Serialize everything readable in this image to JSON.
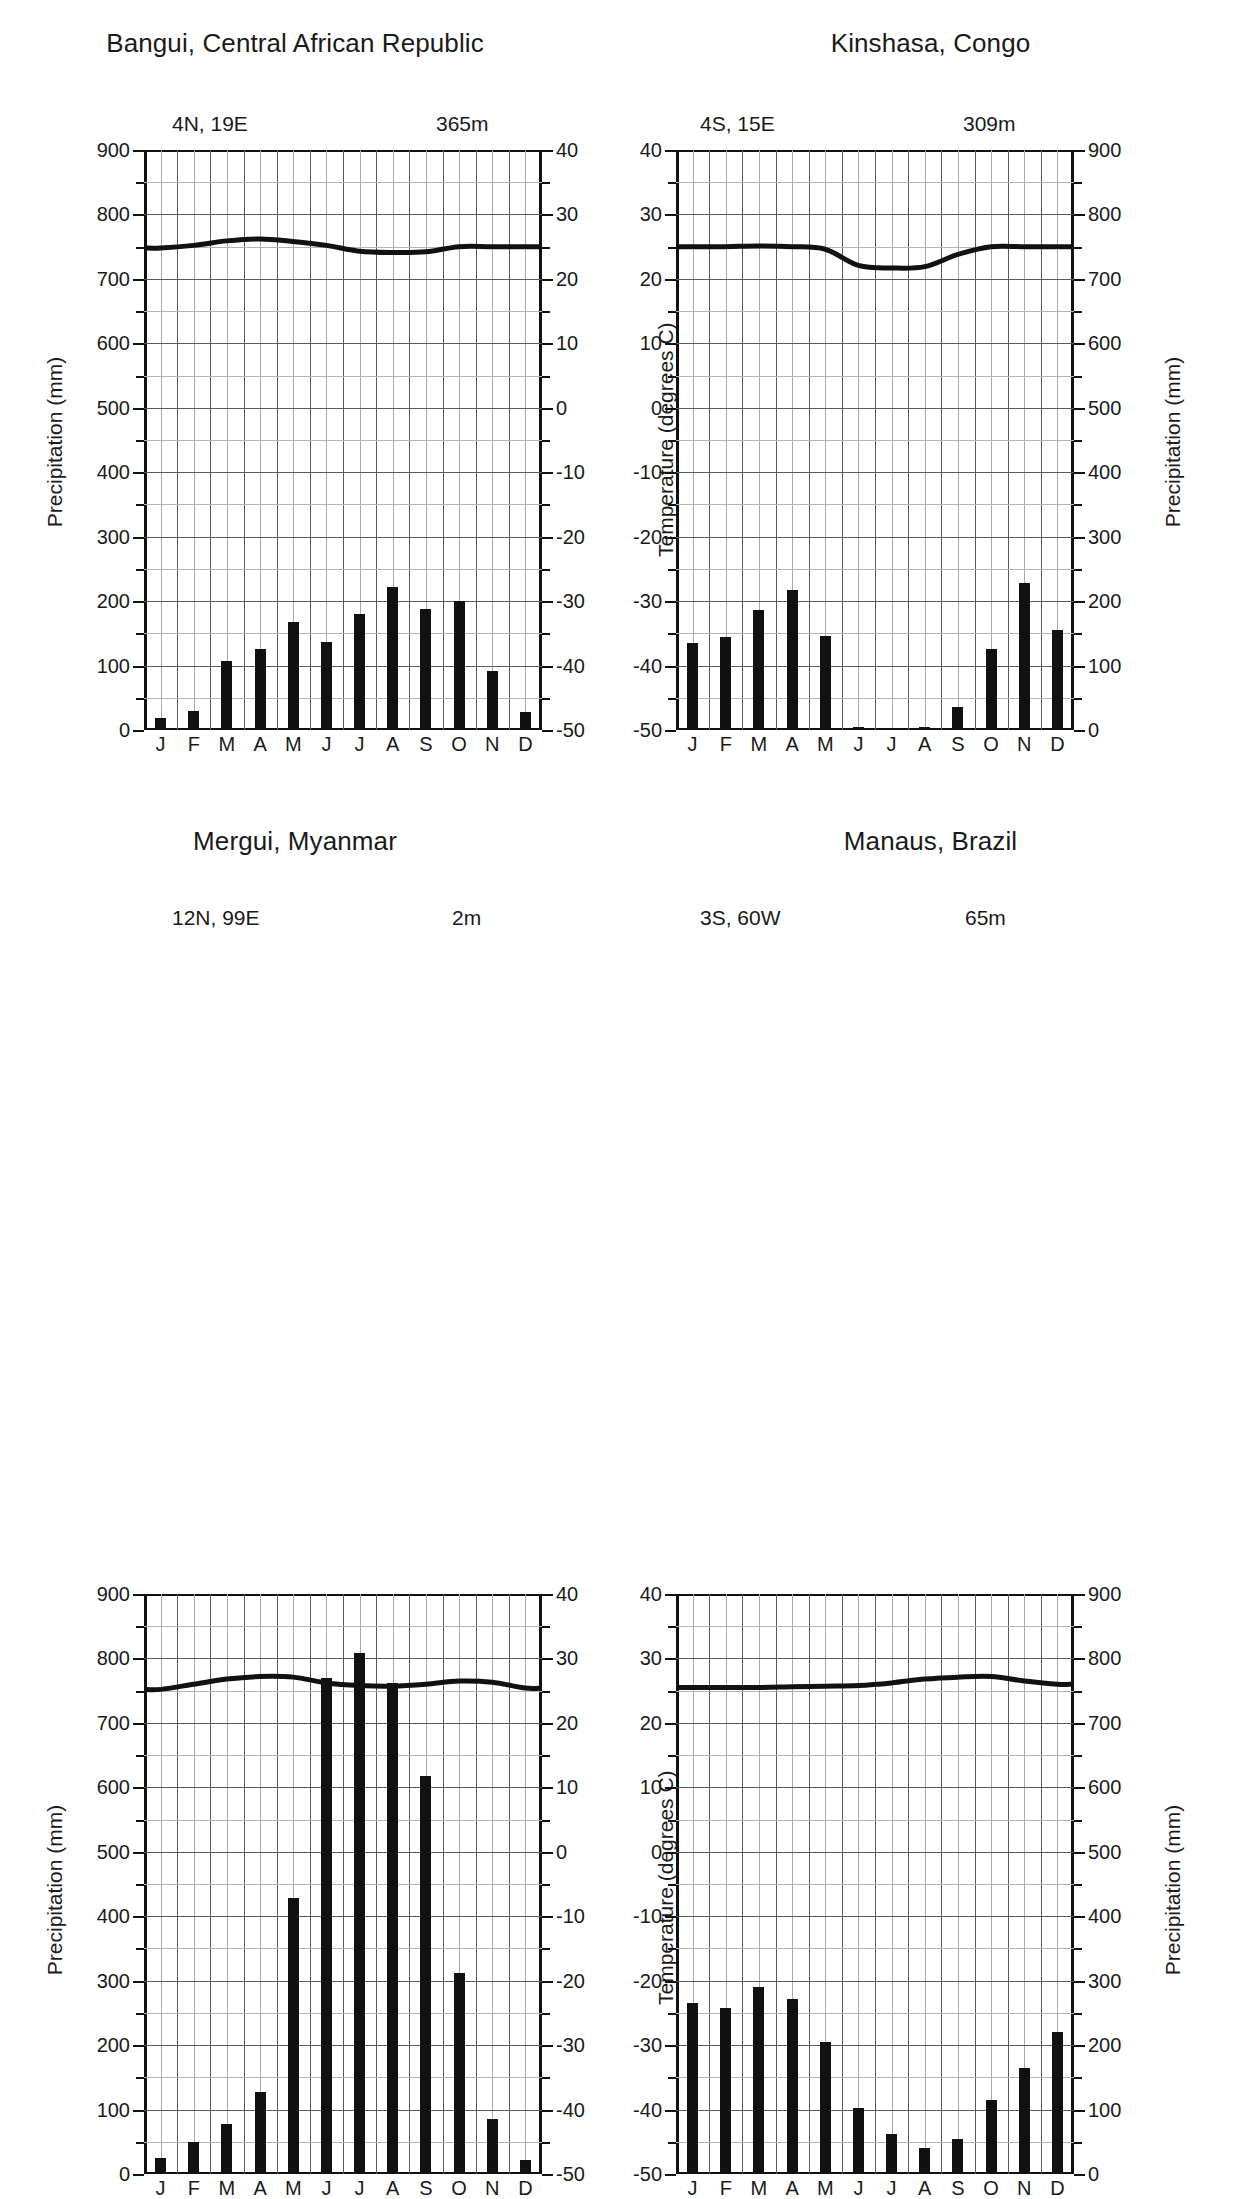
{
  "figure": {
    "kind": "climate-diagrams",
    "panel_count": 4,
    "month_labels": [
      "J",
      "F",
      "M",
      "A",
      "M",
      "J",
      "J",
      "A",
      "S",
      "O",
      "N",
      "D"
    ],
    "precip_axis_label": "Precipitation  (mm)",
    "temp_axis_label": "Temperature (degrees C)",
    "precip_ticks": [
      "0",
      "100",
      "200",
      "300",
      "400",
      "500",
      "600",
      "700",
      "800",
      "900"
    ],
    "temp_ticks": [
      "-50",
      "-40",
      "-30",
      "-20",
      "-10",
      "0",
      "10",
      "20",
      "30",
      "40"
    ]
  },
  "panels": [
    {
      "id": "bangui",
      "title": "Bangui, Central African Republic",
      "coordinates": "4N, 19E",
      "elevation": "365m",
      "precip_side": "left",
      "temp_side": "right",
      "chart_data": {
        "type": "bar",
        "title": "Bangui, Central African Republic",
        "categories": [
          "J",
          "F",
          "M",
          "A",
          "M",
          "J",
          "J",
          "A",
          "S",
          "O",
          "N",
          "D"
        ],
        "values": [
          18,
          30,
          107,
          126,
          167,
          137,
          180,
          222,
          188,
          200,
          92,
          28
        ],
        "xlabel": "",
        "ylabel": "Precipitation  (mm)",
        "ylim": [
          0,
          900
        ],
        "grid": true,
        "series": [
          {
            "name": "Precipitation (mm)",
            "type": "bar",
            "values": [
              18,
              30,
              107,
              126,
              167,
              137,
              180,
              222,
              188,
              200,
              92,
              28
            ]
          },
          {
            "name": "Temperature (degrees C)",
            "type": "line",
            "axis": "right",
            "ylim": [
              -50,
              40
            ],
            "values": [
              24.8,
              25.2,
              25.9,
              26.2,
              25.8,
              25.2,
              24.3,
              24.1,
              24.2,
              25.0,
              25.0,
              25.0
            ]
          }
        ]
      }
    },
    {
      "id": "kinshasa",
      "title": "Kinshasa, Congo",
      "coordinates": "4S, 15E",
      "elevation": "309m",
      "precip_side": "right",
      "temp_side": "left",
      "chart_data": {
        "type": "bar",
        "title": "Kinshasa, Congo",
        "categories": [
          "J",
          "F",
          "M",
          "A",
          "M",
          "J",
          "J",
          "A",
          "S",
          "O",
          "N",
          "D"
        ],
        "values": [
          135,
          145,
          186,
          217,
          146,
          5,
          3,
          4,
          35,
          125,
          228,
          155
        ],
        "xlabel": "",
        "ylabel": "Precipitation  (mm)",
        "ylim": [
          0,
          900
        ],
        "grid": true,
        "series": [
          {
            "name": "Precipitation (mm)",
            "type": "bar",
            "axis": "right",
            "values": [
              135,
              145,
              186,
              217,
              146,
              5,
              3,
              4,
              35,
              125,
              228,
              155
            ]
          },
          {
            "name": "Temperature (degrees C)",
            "type": "line",
            "axis": "left",
            "ylim": [
              -50,
              40
            ],
            "values": [
              25.0,
              25.0,
              25.1,
              25.0,
              24.6,
              22.1,
              21.7,
              21.9,
              23.8,
              25.0,
              25.0,
              25.0
            ]
          }
        ]
      }
    },
    {
      "id": "mergui",
      "title": "Mergui, Myanmar",
      "coordinates": "12N, 99E",
      "elevation": "2m",
      "precip_side": "left",
      "temp_side": "right",
      "chart_data": {
        "type": "bar",
        "title": "Mergui, Myanmar",
        "categories": [
          "J",
          "F",
          "M",
          "A",
          "M",
          "J",
          "J",
          "A",
          "S",
          "O",
          "N",
          "D"
        ],
        "values": [
          25,
          50,
          77,
          128,
          428,
          770,
          808,
          762,
          618,
          312,
          85,
          22
        ],
        "xlabel": "",
        "ylabel": "Precipitation  (mm)",
        "ylim": [
          0,
          900
        ],
        "grid": true,
        "series": [
          {
            "name": "Precipitation (mm)",
            "type": "bar",
            "values": [
              25,
              50,
              77,
              128,
              428,
              770,
              808,
              762,
              618,
              312,
              85,
              22
            ]
          },
          {
            "name": "Temperature (degrees C)",
            "type": "line",
            "axis": "right",
            "ylim": [
              -50,
              40
            ],
            "values": [
              25.2,
              26.0,
              26.8,
              27.2,
              27.1,
              26.2,
              25.8,
              25.7,
              26.0,
              26.5,
              26.3,
              25.4
            ]
          }
        ]
      }
    },
    {
      "id": "manaus",
      "title": "Manaus, Brazil",
      "coordinates": "3S, 60W",
      "elevation": "65m",
      "precip_side": "right",
      "temp_side": "left",
      "chart_data": {
        "type": "bar",
        "title": "Manaus, Brazil",
        "categories": [
          "J",
          "F",
          "M",
          "A",
          "M",
          "J",
          "J",
          "A",
          "S",
          "O",
          "N",
          "D"
        ],
        "values": [
          265,
          258,
          290,
          272,
          205,
          102,
          62,
          40,
          55,
          115,
          165,
          220
        ],
        "xlabel": "",
        "ylabel": "Precipitation  (mm)",
        "ylim": [
          0,
          900
        ],
        "grid": true,
        "series": [
          {
            "name": "Precipitation (mm)",
            "type": "bar",
            "axis": "right",
            "values": [
              265,
              258,
              290,
              272,
              205,
              102,
              62,
              40,
              55,
              115,
              165,
              220
            ]
          },
          {
            "name": "Temperature (degrees C)",
            "type": "line",
            "axis": "left",
            "ylim": [
              -50,
              40
            ],
            "values": [
              25.5,
              25.5,
              25.5,
              25.6,
              25.7,
              25.8,
              26.2,
              26.8,
              27.1,
              27.2,
              26.5,
              26.0
            ]
          }
        ]
      }
    }
  ]
}
